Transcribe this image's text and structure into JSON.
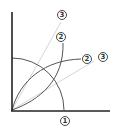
{
  "diagram": {
    "colors": {
      "axis": "#222222",
      "arc": "#555555",
      "ray": "#d0d0d0",
      "label": "#333333"
    },
    "labels": {
      "bottom": "1",
      "upper_two": "2",
      "upper_three": "3",
      "right_two": "2",
      "right_three": "3"
    }
  }
}
